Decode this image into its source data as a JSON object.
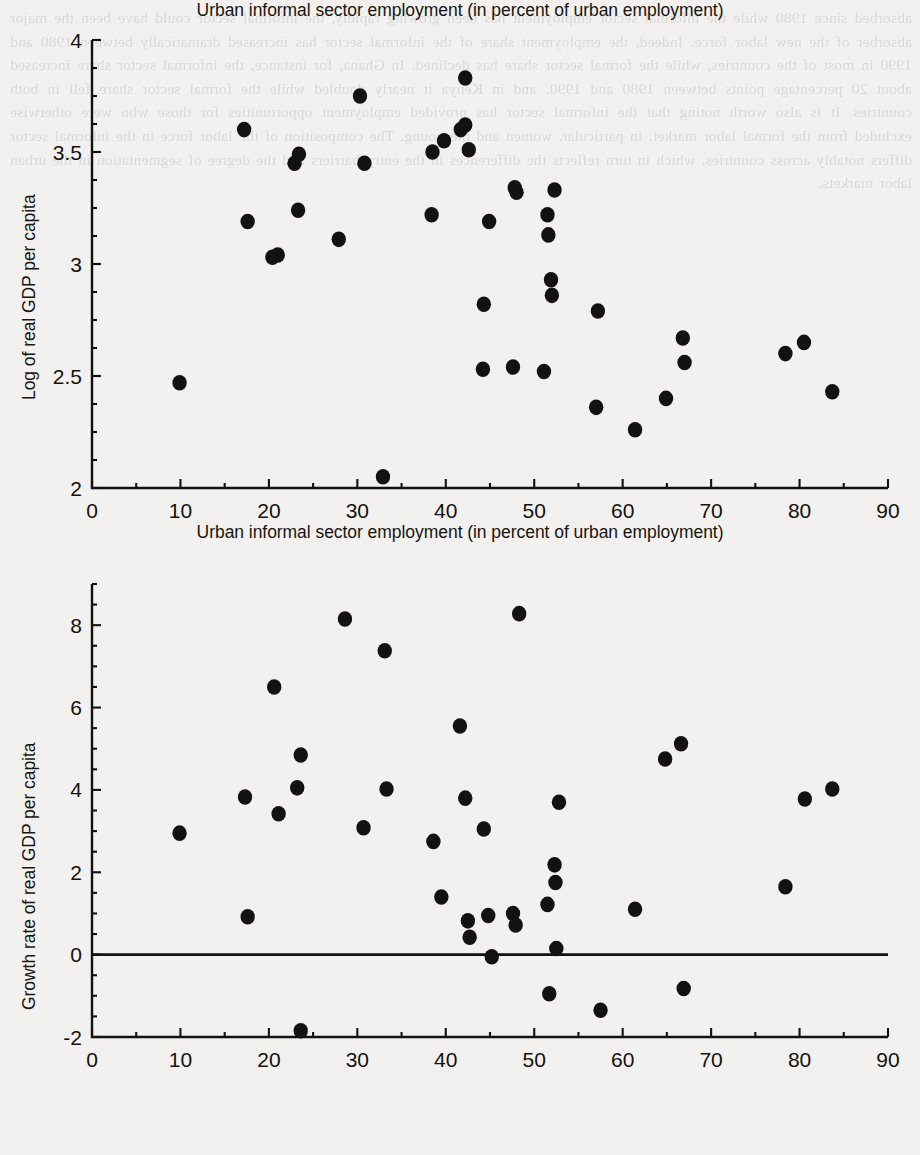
{
  "page": {
    "background_color": "#f2f1ef",
    "ink_color": "#121210",
    "bleed_through_text": "absorbed since 1980 while the informal sector employment has been growing rapidly, the informal sector could have been the major absorber of the new labor force. Indeed, the employment share of the informal sector has increased dramatically between 1980 and 1990 in most of the countries, while the formal sector share has declined. In Ghana, for instance, the informal sector share increased about 20 percentage points between 1980 and 1990, and in Kenya it nearly doubled while the formal sector share fell in both countries. It is also worth noting that the informal sector has provided employment opportunities for those who were otherwise excluded from the formal labor market, in particular, women and the young. The composition of the labor force in the informal sector differs notably across countries, which in turn reflects the differences in the entry barriers and the degree of segmentation in the urban labor markets."
  },
  "charts": [
    {
      "id": "top",
      "type": "scatter",
      "title": "",
      "xlabel": "Urban informal sector employment (in percent of urban employment)",
      "ylabel": "Log of real GDP per capita",
      "xlim": [
        0,
        90
      ],
      "ylim": [
        2,
        4
      ],
      "xticks": [
        0,
        10,
        20,
        30,
        40,
        50,
        60,
        70,
        80,
        90
      ],
      "xtick_labels": [
        "0",
        "10",
        "20",
        "30",
        "40",
        "50",
        "60",
        "70",
        "80",
        "90"
      ],
      "x_minor_tick_step": 5,
      "yticks": [
        2,
        2.5,
        3,
        3.5,
        4
      ],
      "ytick_labels": [
        "2",
        "2.5",
        "3",
        "3.5",
        "4"
      ],
      "y_minor_tick_step": 0.125,
      "grid": false,
      "legend": "none",
      "zero_line": false,
      "marker": {
        "shape": "circle",
        "color": "#121210",
        "radius": 7.2
      },
      "points": [
        {
          "x": 9.9,
          "y": 2.47
        },
        {
          "x": 17.2,
          "y": 3.6
        },
        {
          "x": 17.6,
          "y": 3.19
        },
        {
          "x": 20.4,
          "y": 3.03
        },
        {
          "x": 21.0,
          "y": 3.04
        },
        {
          "x": 22.9,
          "y": 3.45
        },
        {
          "x": 23.4,
          "y": 3.49
        },
        {
          "x": 23.3,
          "y": 3.24
        },
        {
          "x": 27.9,
          "y": 3.11
        },
        {
          "x": 30.3,
          "y": 3.75
        },
        {
          "x": 30.8,
          "y": 3.45
        },
        {
          "x": 32.9,
          "y": 2.05
        },
        {
          "x": 38.5,
          "y": 3.5
        },
        {
          "x": 38.4,
          "y": 3.22
        },
        {
          "x": 39.8,
          "y": 3.55
        },
        {
          "x": 41.7,
          "y": 3.6
        },
        {
          "x": 42.2,
          "y": 3.62
        },
        {
          "x": 42.2,
          "y": 3.83
        },
        {
          "x": 42.6,
          "y": 3.51
        },
        {
          "x": 44.2,
          "y": 2.53
        },
        {
          "x": 44.3,
          "y": 2.82
        },
        {
          "x": 44.9,
          "y": 3.19
        },
        {
          "x": 47.6,
          "y": 2.54
        },
        {
          "x": 47.8,
          "y": 3.34
        },
        {
          "x": 48.0,
          "y": 3.32
        },
        {
          "x": 51.1,
          "y": 2.52
        },
        {
          "x": 51.5,
          "y": 3.22
        },
        {
          "x": 51.6,
          "y": 3.13
        },
        {
          "x": 51.9,
          "y": 2.93
        },
        {
          "x": 52.0,
          "y": 2.86
        },
        {
          "x": 52.3,
          "y": 3.33
        },
        {
          "x": 57.0,
          "y": 2.36
        },
        {
          "x": 57.2,
          "y": 2.79
        },
        {
          "x": 61.4,
          "y": 2.26
        },
        {
          "x": 64.9,
          "y": 2.4
        },
        {
          "x": 66.8,
          "y": 2.67
        },
        {
          "x": 67.0,
          "y": 2.56
        },
        {
          "x": 78.4,
          "y": 2.6
        },
        {
          "x": 80.5,
          "y": 2.65
        },
        {
          "x": 83.7,
          "y": 2.43
        }
      ]
    },
    {
      "id": "bottom",
      "type": "scatter",
      "title": "",
      "xlabel": "Urban informal sector employment (in percent of urban employment)",
      "ylabel": "Growth rate of real GDP per capita",
      "xlim": [
        0,
        90
      ],
      "ylim": [
        -2,
        9
      ],
      "xticks": [
        0,
        10,
        20,
        30,
        40,
        50,
        60,
        70,
        80,
        90
      ],
      "xtick_labels": [
        "0",
        "10",
        "20",
        "30",
        "40",
        "50",
        "60",
        "70",
        "80",
        "90"
      ],
      "x_minor_tick_step": 5,
      "yticks": [
        -2,
        0,
        2,
        4,
        6,
        8
      ],
      "ytick_labels": [
        "-2",
        "0",
        "2",
        "4",
        "6",
        "8"
      ],
      "y_minor_tick_step": 0.5,
      "grid": false,
      "legend": "none",
      "zero_line": true,
      "zero_line_value": 0,
      "marker": {
        "shape": "circle",
        "color": "#121210",
        "radius": 7.2
      },
      "points": [
        {
          "x": 9.9,
          "y": 2.95
        },
        {
          "x": 17.3,
          "y": 3.83
        },
        {
          "x": 17.6,
          "y": 0.92
        },
        {
          "x": 20.6,
          "y": 6.5
        },
        {
          "x": 21.1,
          "y": 3.42
        },
        {
          "x": 23.2,
          "y": 4.05
        },
        {
          "x": 23.6,
          "y": 4.85
        },
        {
          "x": 23.6,
          "y": -1.85
        },
        {
          "x": 28.6,
          "y": 8.15
        },
        {
          "x": 30.7,
          "y": 3.08
        },
        {
          "x": 33.1,
          "y": 7.38
        },
        {
          "x": 33.3,
          "y": 4.02
        },
        {
          "x": 38.6,
          "y": 2.75
        },
        {
          "x": 39.5,
          "y": 1.4
        },
        {
          "x": 41.6,
          "y": 5.55
        },
        {
          "x": 42.2,
          "y": 3.8
        },
        {
          "x": 42.5,
          "y": 0.82
        },
        {
          "x": 42.7,
          "y": 0.42
        },
        {
          "x": 44.3,
          "y": 3.05
        },
        {
          "x": 44.8,
          "y": 0.95
        },
        {
          "x": 45.2,
          "y": -0.05
        },
        {
          "x": 47.6,
          "y": 1.0
        },
        {
          "x": 47.9,
          "y": 0.72
        },
        {
          "x": 48.3,
          "y": 8.28
        },
        {
          "x": 51.5,
          "y": 1.22
        },
        {
          "x": 51.7,
          "y": -0.95
        },
        {
          "x": 52.3,
          "y": 2.18
        },
        {
          "x": 52.4,
          "y": 1.75
        },
        {
          "x": 52.5,
          "y": 0.15
        },
        {
          "x": 52.8,
          "y": 3.7
        },
        {
          "x": 57.5,
          "y": -1.35
        },
        {
          "x": 61.4,
          "y": 1.1
        },
        {
          "x": 64.8,
          "y": 4.75
        },
        {
          "x": 66.6,
          "y": 5.12
        },
        {
          "x": 66.9,
          "y": -0.82
        },
        {
          "x": 78.4,
          "y": 1.65
        },
        {
          "x": 80.6,
          "y": 3.78
        },
        {
          "x": 83.7,
          "y": 4.02
        }
      ]
    }
  ]
}
